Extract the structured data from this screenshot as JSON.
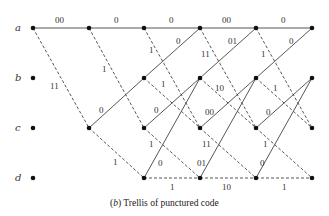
{
  "diagram": {
    "type": "trellis",
    "caption": {
      "prefix": "(",
      "letter": "b",
      "suffix": ") Trellis of punctured code"
    },
    "states": [
      {
        "id": "a",
        "label": "a"
      },
      {
        "id": "b",
        "label": "b"
      },
      {
        "id": "c",
        "label": "c"
      },
      {
        "id": "d",
        "label": "d"
      }
    ],
    "time_steps": 6,
    "legend": {
      "solid_line": "input 0",
      "dashed_line": "input 1"
    },
    "stages": [
      {
        "stage": 1,
        "edges": [
          {
            "from": "a",
            "to": "a",
            "style": "solid",
            "label": "00"
          },
          {
            "from": "a",
            "to": "c",
            "style": "dashed",
            "label": "11"
          }
        ]
      },
      {
        "stage": 2,
        "edges": [
          {
            "from": "a",
            "to": "a",
            "style": "solid",
            "label": "0"
          },
          {
            "from": "a",
            "to": "c",
            "style": "dashed",
            "label": "1"
          },
          {
            "from": "c",
            "to": "b",
            "style": "solid",
            "label": "0"
          },
          {
            "from": "c",
            "to": "d",
            "style": "dashed",
            "label": "1"
          }
        ]
      },
      {
        "stage": 3,
        "edges": [
          {
            "from": "a",
            "to": "a",
            "style": "solid",
            "label": "0"
          },
          {
            "from": "a",
            "to": "c",
            "style": "dashed",
            "label": "1"
          },
          {
            "from": "b",
            "to": "a",
            "style": "solid",
            "label": "0"
          },
          {
            "from": "b",
            "to": "c",
            "style": "dashed",
            "label": "1"
          },
          {
            "from": "c",
            "to": "b",
            "style": "solid",
            "label": "0"
          },
          {
            "from": "c",
            "to": "d",
            "style": "dashed",
            "label": "1"
          },
          {
            "from": "d",
            "to": "b",
            "style": "solid",
            "label": "0"
          },
          {
            "from": "d",
            "to": "d",
            "style": "dashed",
            "label": "1"
          }
        ]
      },
      {
        "stage": 4,
        "edges": [
          {
            "from": "a",
            "to": "a",
            "style": "solid",
            "label": "00"
          },
          {
            "from": "a",
            "to": "c",
            "style": "dashed",
            "label": "11"
          },
          {
            "from": "b",
            "to": "a",
            "style": "solid",
            "label": "01"
          },
          {
            "from": "b",
            "to": "c",
            "style": "dashed",
            "label": "10"
          },
          {
            "from": "c",
            "to": "b",
            "style": "solid",
            "label": "00"
          },
          {
            "from": "c",
            "to": "d",
            "style": "dashed",
            "label": "11"
          },
          {
            "from": "d",
            "to": "b",
            "style": "solid",
            "label": "01"
          },
          {
            "from": "d",
            "to": "d",
            "style": "dashed",
            "label": "10"
          }
        ]
      },
      {
        "stage": 5,
        "edges": [
          {
            "from": "a",
            "to": "a",
            "style": "solid",
            "label": "0"
          },
          {
            "from": "a",
            "to": "c",
            "style": "dashed",
            "label": "1"
          },
          {
            "from": "b",
            "to": "a",
            "style": "solid",
            "label": "0"
          },
          {
            "from": "b",
            "to": "c",
            "style": "dashed",
            "label": "1"
          },
          {
            "from": "c",
            "to": "b",
            "style": "solid",
            "label": "0"
          },
          {
            "from": "c",
            "to": "d",
            "style": "dashed",
            "label": "1"
          },
          {
            "from": "d",
            "to": "b",
            "style": "solid",
            "label": "0"
          },
          {
            "from": "d",
            "to": "d",
            "style": "dashed",
            "label": "1"
          }
        ]
      }
    ]
  }
}
